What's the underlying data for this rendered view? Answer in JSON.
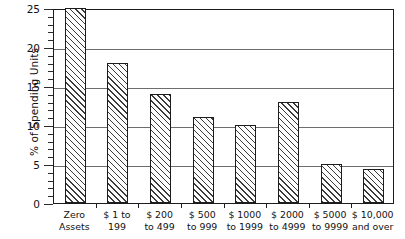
{
  "chart_data": {
    "type": "bar",
    "title": "",
    "subtitle": "",
    "xlabel": "",
    "ylabel": "% of Spending Units",
    "ylim": [
      0,
      25
    ],
    "ytick_values": [
      0,
      5,
      10,
      15,
      20,
      25
    ],
    "ytick_labels": [
      "0",
      "5",
      "10",
      "15",
      "20",
      "25"
    ],
    "minor_tick_interval": 1,
    "grid": "horizontal",
    "gridline_values": [
      5,
      10,
      15,
      20,
      25
    ],
    "legend": "none",
    "bar_style": "diagonal-hatch",
    "categories": [
      "Zero Assets",
      "$ 1 to 199",
      "$ 200 to 499",
      "$ 500 to 999",
      "$ 1000 to 1999",
      "$ 2000 to 4999",
      "$ 5000 to 9999",
      "$ 10,000 and over"
    ],
    "category_lines": [
      {
        "line1": "Zero",
        "line2": "Assets"
      },
      {
        "line1": "$ 1 to",
        "line2": "199"
      },
      {
        "line1": "$ 200",
        "line2": "to 499"
      },
      {
        "line1": "$ 500",
        "line2": "to 999"
      },
      {
        "line1": "$ 1000",
        "line2": "to 1999"
      },
      {
        "line1": "$ 2000",
        "line2": "to 4999"
      },
      {
        "line1": "$ 5000",
        "line2": "to 9999"
      },
      {
        "line1": "$ 10,000",
        "line2": "and over"
      }
    ],
    "values": [
      25,
      18,
      14,
      11,
      10,
      13,
      5,
      4.3
    ],
    "colors": {
      "bar_fill": "#fdfdfd",
      "bar_hatch": "#3a3a3a",
      "bar_edge": "#1c1c1c",
      "gridline": "#6d6d6d",
      "axis": "#1c1c1c",
      "text": "#111111",
      "background": "#ffffff"
    }
  }
}
